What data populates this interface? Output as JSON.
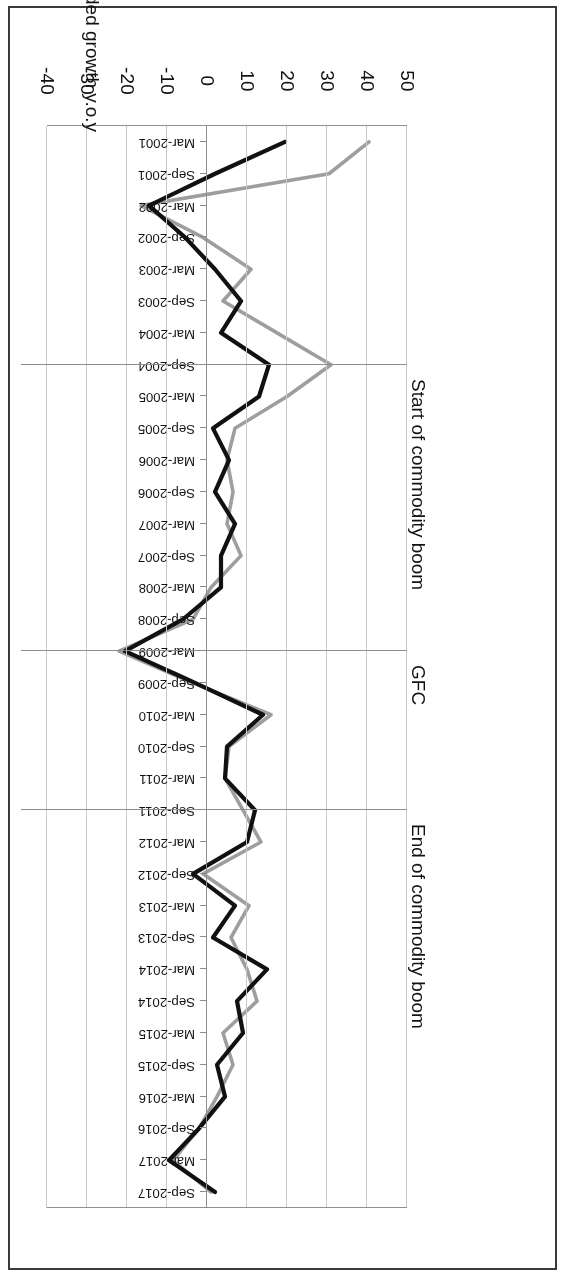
{
  "figure": {
    "rotation_degrees": 180,
    "background": "#ffffff",
    "border_color": "#3a3a3a"
  },
  "axis": {
    "y_axis_title": "% real value-added growth y.o.y",
    "y_ticks": [
      "50",
      "40",
      "30",
      "20",
      "10",
      "0",
      "-10",
      "-20",
      "-30",
      "-40"
    ]
  },
  "legend": {
    "items": [
      {
        "label": "Export Growth",
        "color": "#111111"
      },
      {
        "label": "Import Growth",
        "color": "#9e9e9e"
      }
    ]
  },
  "annotations": [
    {
      "label": "Start of commodity boom",
      "at": "Sep-2004"
    },
    {
      "label": "GFC",
      "at": "Mar-2009"
    },
    {
      "label": "End of commodity boom",
      "at": "Sep-2011"
    }
  ],
  "chart_data": {
    "type": "line",
    "title": "",
    "xlabel": "",
    "ylabel": "% real value-added growth y.o.y",
    "ylim": [
      -40,
      50
    ],
    "ytick_step": 10,
    "grid": true,
    "legend_position": "right",
    "categories": [
      "Mar-2001",
      "Sep-2001",
      "Mar-2002",
      "Sep-2002",
      "Mar-2003",
      "Sep-2003",
      "Mar-2004",
      "Sep-2004",
      "Mar-2005",
      "Sep-2005",
      "Mar-2006",
      "Sep-2006",
      "Mar-2007",
      "Sep-2007",
      "Mar-2008",
      "Sep-2008",
      "Mar-2009",
      "Sep-2009",
      "Mar-2010",
      "Sep-2010",
      "Mar-2011",
      "Sep-2011",
      "Mar-2012",
      "Sep-2012",
      "Mar-2013",
      "Sep-2013",
      "Mar-2014",
      "Sep-2014",
      "Mar-2015",
      "Sep-2015",
      "Mar-2016",
      "Sep-2016",
      "Mar-2017",
      "Sep-2017"
    ],
    "series": [
      {
        "name": "Export Growth",
        "color": "#111111",
        "values": [
          19.5,
          2.0,
          -14.5,
          -5.5,
          2.0,
          8.5,
          3.5,
          15.5,
          13.0,
          1.5,
          5.5,
          2.0,
          7.0,
          3.5,
          3.5,
          -6.0,
          -20.5,
          -3.0,
          14.0,
          5.0,
          4.5,
          12.0,
          10.0,
          -3.5,
          7.0,
          1.5,
          15.0,
          7.5,
          9.0,
          2.5,
          4.5,
          -2.0,
          -9.5,
          2.0
        ]
      },
      {
        "name": "Import Growth",
        "color": "#9e9e9e",
        "values": [
          40.5,
          30.5,
          -16.5,
          -1.0,
          11.0,
          4.0,
          17.5,
          31.0,
          20.0,
          7.0,
          5.0,
          6.5,
          5.0,
          8.5,
          1.0,
          -3.5,
          -22.0,
          -3.5,
          16.0,
          5.5,
          4.5,
          9.0,
          13.5,
          -1.0,
          10.5,
          6.0,
          10.0,
          12.5,
          4.0,
          6.5,
          2.5,
          -2.0,
          -8.5,
          1.0
        ]
      }
    ]
  }
}
